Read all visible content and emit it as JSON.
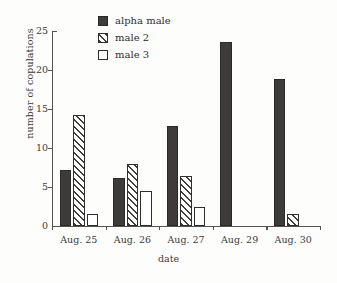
{
  "chart_data": {
    "type": "bar",
    "title": "",
    "xlabel": "date",
    "ylabel": "number of copulations",
    "categories": [
      "Aug. 25",
      "Aug. 26",
      "Aug. 27",
      "Aug. 29",
      "Aug. 30"
    ],
    "series": [
      {
        "name": "alpha male",
        "style": "solid",
        "values": [
          7.2,
          6.2,
          12.8,
          23.6,
          18.8
        ]
      },
      {
        "name": "male 2",
        "style": "hatched",
        "values": [
          14.2,
          8.0,
          6.4,
          0,
          1.5
        ]
      },
      {
        "name": "male 3",
        "style": "open",
        "values": [
          1.5,
          4.5,
          2.4,
          0,
          0
        ]
      }
    ],
    "ylim": [
      0,
      25
    ],
    "yticks": [
      0,
      5,
      10,
      15,
      20,
      25
    ],
    "ytick_labels": [
      "0",
      "5",
      "10",
      "15",
      "20",
      "25"
    ],
    "grid": false,
    "legend_position": "top-center",
    "colors": {
      "alpha_male": "#3d3c3b",
      "male_2": "#3f3e3d",
      "male_3": "#ffffff",
      "axis": "#55524f",
      "text": "#3a3a3a",
      "background": "#fdfdfc"
    }
  },
  "legend": {
    "items": [
      {
        "label": "alpha male",
        "style": "solid"
      },
      {
        "label": "male 2",
        "style": "hatch"
      },
      {
        "label": "male 3",
        "style": "open"
      }
    ]
  }
}
